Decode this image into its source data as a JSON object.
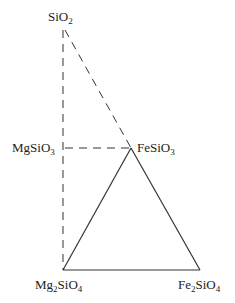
{
  "diagram": {
    "type": "phase-diagram",
    "vertices": {
      "top": {
        "label": "SiO",
        "sub": "2",
        "x": 63,
        "y": 28
      },
      "left_mid": {
        "label": "MgSiO",
        "sub": "3",
        "x": 63,
        "y": 148
      },
      "right_mid": {
        "label": "FeSiO",
        "sub": "3",
        "x": 131,
        "y": 148
      },
      "bottom_left": {
        "label_a": "Mg",
        "sub_a": "2",
        "label_b": "SiO",
        "sub_b": "4",
        "x": 63,
        "y": 270
      },
      "bottom_right": {
        "label_a": "Fe",
        "sub_a": "2",
        "label_b": "SiO",
        "sub_b": "4",
        "x": 200,
        "y": 270
      }
    },
    "dashed_lines": [
      {
        "from": "top",
        "to": "bottom_left"
      },
      {
        "from": "top",
        "to": "right_mid"
      },
      {
        "from": "left_mid",
        "to": "right_mid"
      }
    ],
    "solid_lines": [
      {
        "from": "right_mid",
        "to": "bottom_left"
      },
      {
        "from": "right_mid",
        "to": "bottom_right"
      },
      {
        "from": "bottom_left",
        "to": "bottom_right"
      }
    ],
    "line_color": "#333333"
  }
}
